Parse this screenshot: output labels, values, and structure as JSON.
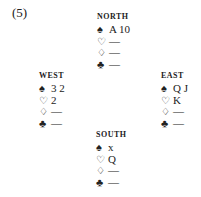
{
  "problem_number": "(5)",
  "suit_symbols": {
    "spades": "♠",
    "hearts": "♡",
    "diamonds": "♢",
    "clubs": "♣"
  },
  "hands": {
    "north": {
      "label": "NORTH",
      "spades": "A 10",
      "hearts": "—",
      "diamonds": "—",
      "clubs": "—"
    },
    "west": {
      "label": "WEST",
      "spades": "3 2",
      "hearts": "2",
      "diamonds": "—",
      "clubs": "—"
    },
    "east": {
      "label": "EAST",
      "spades": "Q J",
      "hearts": "K",
      "diamonds": "—",
      "clubs": "—"
    },
    "south": {
      "label": "SOUTH",
      "spades": "x",
      "hearts": "Q",
      "diamonds": "—",
      "clubs": "—"
    }
  }
}
